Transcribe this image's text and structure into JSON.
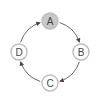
{
  "diagram": {
    "type": "cycle",
    "direction": "clockwise",
    "nodes": [
      {
        "id": "A",
        "label": "A",
        "highlighted": true
      },
      {
        "id": "B",
        "label": "B",
        "highlighted": false
      },
      {
        "id": "C",
        "label": "C",
        "highlighted": false
      },
      {
        "id": "D",
        "label": "D",
        "highlighted": false
      }
    ],
    "edges": [
      {
        "from": "A",
        "to": "B"
      },
      {
        "from": "B",
        "to": "C"
      },
      {
        "from": "C",
        "to": "D"
      },
      {
        "from": "D",
        "to": "A"
      }
    ],
    "colors": {
      "highlight_fill": "#c8c8c8",
      "node_fill": "#ffffff",
      "node_stroke": "#bdbdbd",
      "edge": "#555555",
      "label": "#444444"
    }
  }
}
